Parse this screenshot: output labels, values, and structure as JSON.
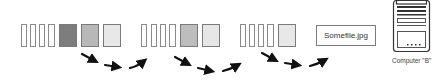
{
  "diagram": {
    "groups": [
      {
        "name": "stream-segment-1",
        "thin_bars": 4,
        "blocks": [
          {
            "shade": "dark",
            "color": "#7d7d7d"
          },
          {
            "shade": "medium",
            "color": "#b8b8b8"
          },
          {
            "shade": "light",
            "color": "#e8e8e8"
          }
        ]
      },
      {
        "name": "stream-segment-2",
        "thin_bars": 4,
        "blocks": [
          {
            "shade": "medium",
            "color": "#bdbdbd"
          },
          {
            "shade": "light",
            "color": "#e6e6e6"
          }
        ]
      },
      {
        "name": "stream-segment-3",
        "thin_bars": 4,
        "blocks": [
          {
            "shade": "light",
            "color": "#e8e8e8"
          }
        ]
      }
    ],
    "file": {
      "label": "Somefile.jpg"
    },
    "computer": {
      "label": "Computer \"B\"",
      "drive_dots": "...."
    },
    "arrow_color": "#111111"
  }
}
